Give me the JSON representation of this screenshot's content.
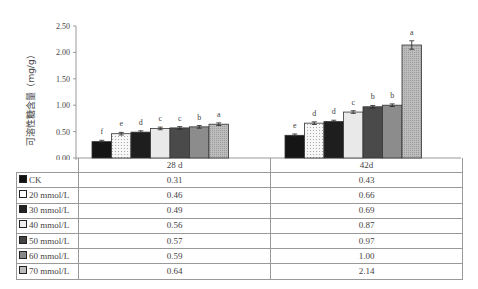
{
  "chart_data": {
    "type": "bar",
    "title": "",
    "xlabel": "",
    "ylabel": "可溶性糖含量（mg/g）",
    "ylim": [
      0,
      2.5
    ],
    "yticks": [
      "0.00",
      "0.50",
      "1.00",
      "1.50",
      "2.00",
      "2.50"
    ],
    "grid": false,
    "legend_position": "data-table",
    "categories": [
      "28 d",
      "42d"
    ],
    "series": [
      {
        "name": "CK",
        "values": [
          0.31,
          0.43
        ],
        "letters": [
          "f",
          "e"
        ],
        "color": "#111111"
      },
      {
        "name": "20 mmol/L",
        "values": [
          0.46,
          0.66
        ],
        "letters": [
          "e",
          "d"
        ],
        "color": "#f4f4f4"
      },
      {
        "name": "30 mmol/L",
        "values": [
          0.49,
          0.69
        ],
        "letters": [
          "d",
          "d"
        ],
        "color": "#222222"
      },
      {
        "name": "40 mmol/L",
        "values": [
          0.56,
          0.87
        ],
        "letters": [
          "c",
          "c"
        ],
        "color": "#e6e6e6"
      },
      {
        "name": "50 mmol/L",
        "values": [
          0.57,
          0.97
        ],
        "letters": [
          "c",
          "b"
        ],
        "color": "#444444"
      },
      {
        "name": "60 mmol/L",
        "values": [
          0.59,
          1.0
        ],
        "letters": [
          "b",
          "b"
        ],
        "color": "#8a8a8a"
      },
      {
        "name": "70 mmol/L",
        "values": [
          0.64,
          2.14
        ],
        "letters": [
          "a",
          "a"
        ],
        "color": "#c4c4c4"
      }
    ]
  },
  "table": {
    "headers": [
      "28 d",
      "42d"
    ],
    "rows": [
      {
        "label": "CK",
        "v": [
          "0.31",
          "0.43"
        ]
      },
      {
        "label": "20 mmol/L",
        "v": [
          "0.46",
          "0.66"
        ]
      },
      {
        "label": "30 mmol/L",
        "v": [
          "0.49",
          "0.69"
        ]
      },
      {
        "label": "40 mmol/L",
        "v": [
          "0.56",
          "0.87"
        ]
      },
      {
        "label": "50 mmol/L",
        "v": [
          "0.57",
          "0.97"
        ]
      },
      {
        "label": "60 mmol/L",
        "v": [
          "0.59",
          "1.00"
        ]
      },
      {
        "label": "70 mmol/L",
        "v": [
          "0.64",
          "2.14"
        ]
      }
    ]
  }
}
